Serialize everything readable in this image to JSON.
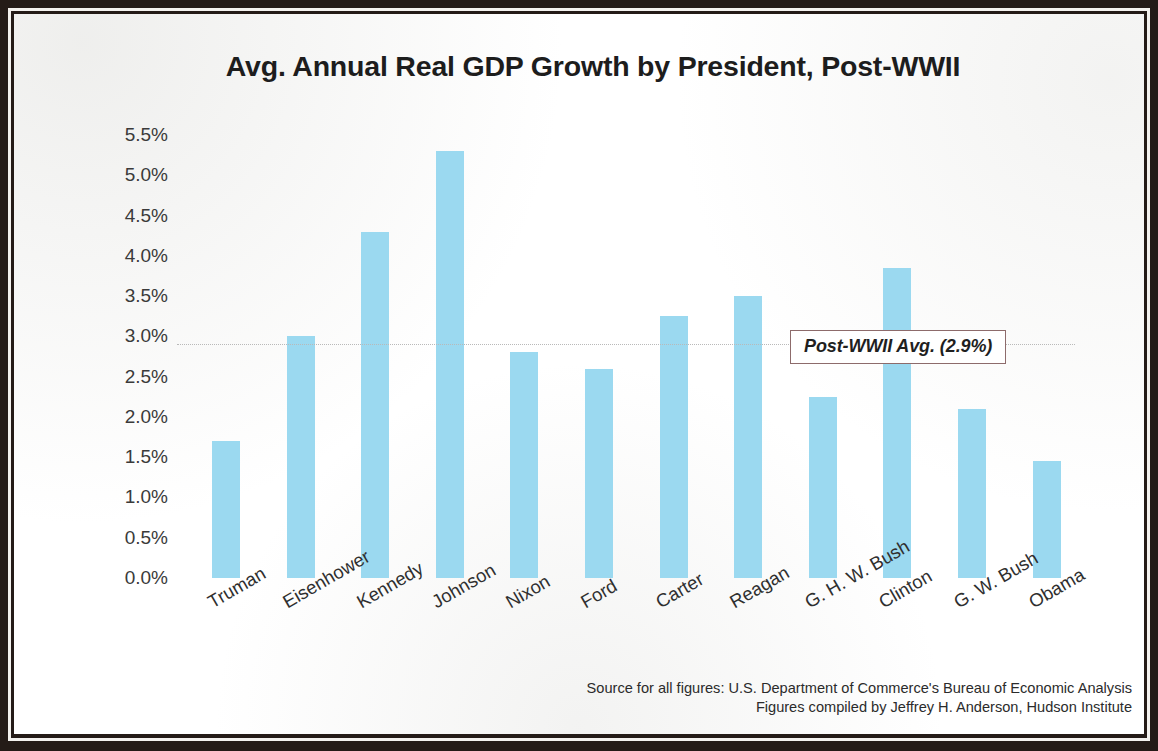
{
  "chart_data": {
    "type": "bar",
    "title": "Avg. Annual Real GDP Growth by President, Post-WWII",
    "xlabel": "",
    "ylabel": "",
    "categories": [
      "Truman",
      "Eisenhower",
      "Kennedy",
      "Johnson",
      "Nixon",
      "Ford",
      "Carter",
      "Reagan",
      "G. H. W. Bush",
      "Clinton",
      "G. W. Bush",
      "Obama"
    ],
    "values": [
      1.7,
      3.0,
      4.3,
      5.3,
      2.8,
      2.6,
      3.25,
      3.5,
      2.25,
      3.85,
      2.1,
      1.45
    ],
    "value_labels": [
      "1.7%",
      "3.0%",
      "4.3%",
      "5.3%",
      "2.8%",
      "2.6%",
      "3.25%",
      "3.5%",
      "2.25%",
      "3.85%",
      "2.1%",
      "1.45%"
    ],
    "ylim": [
      0.0,
      5.5
    ],
    "ytick_labels": [
      "5.5%",
      "5.0%",
      "4.5%",
      "4.0%",
      "3.5%",
      "3.0%",
      "2.5%",
      "2.0%",
      "1.5%",
      "1.0%",
      "0.5%",
      "0.0%"
    ],
    "ytick_values": [
      5.5,
      5.0,
      4.5,
      4.0,
      3.5,
      3.0,
      2.5,
      2.0,
      1.5,
      1.0,
      0.5,
      0.0
    ],
    "grid": false,
    "legend": false,
    "bar_color": "#9bd9f0",
    "annotations": [
      {
        "label": "Post-WWII Avg. (2.9%)",
        "value": 2.9,
        "style": "dotted-reference-line-with-boxed-label"
      }
    ]
  },
  "footer": {
    "source_line_1": "Source for all figures: U.S. Department of Commerce's Bureau of Economic Analysis",
    "source_line_2": "Figures compiled by Jeffrey H. Anderson, Hudson Institute"
  }
}
